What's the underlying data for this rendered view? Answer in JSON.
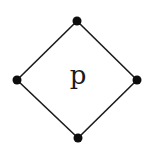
{
  "diagram": {
    "type": "hasse-diagram",
    "shape": "diamond",
    "center_label": "p",
    "colors": {
      "line": "#1a1a1a",
      "node": "#0d0d0d",
      "background": "#ffffff"
    },
    "nodes": [
      {
        "id": "top",
        "x": 77,
        "y": 21
      },
      {
        "id": "left",
        "x": 17,
        "y": 80
      },
      {
        "id": "right",
        "x": 137,
        "y": 80
      },
      {
        "id": "bottom",
        "x": 78,
        "y": 138
      }
    ],
    "edges": [
      {
        "from": "top",
        "to": "left"
      },
      {
        "from": "top",
        "to": "right"
      },
      {
        "from": "left",
        "to": "bottom"
      },
      {
        "from": "right",
        "to": "bottom"
      }
    ]
  }
}
